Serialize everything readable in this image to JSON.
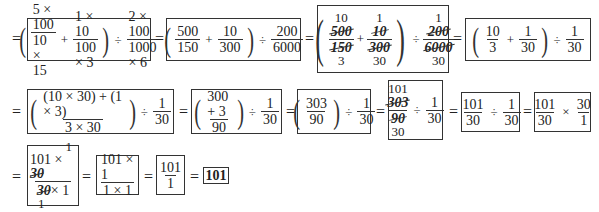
{
  "equals": "=",
  "ops": {
    "times": "×",
    "divide": "÷",
    "plus": "+",
    "lparen": "(",
    "rparen": ")"
  },
  "rows": [
    {
      "steps": [
        {
          "id": "s1",
          "f1": {
            "num": "5 × 100",
            "den": "10 × 15"
          },
          "f2": {
            "num": "1 × 10",
            "den": "100 × 3"
          },
          "f3": {
            "num": "2 × 100",
            "den": "1000 × 6"
          }
        },
        {
          "id": "s2",
          "f1": {
            "num": "500",
            "den": "150"
          },
          "f2": {
            "num": "10",
            "den": "300"
          },
          "f3": {
            "num": "200",
            "den": "6000"
          }
        },
        {
          "id": "s3",
          "f1": {
            "top": "10",
            "num": "500",
            "den": "150",
            "bottom": "3"
          },
          "f2": {
            "top": "1",
            "num": "10",
            "den": "300",
            "bottom": "30"
          },
          "f3": {
            "top": "1",
            "num": "200",
            "den": "6000",
            "bottom": "30"
          }
        },
        {
          "id": "s4",
          "f1": {
            "num": "10",
            "den": "3"
          },
          "f2": {
            "num": "1",
            "den": "30"
          },
          "f3": {
            "num": "1",
            "den": "30"
          }
        }
      ]
    },
    {
      "steps": [
        {
          "id": "s5",
          "f1": {
            "num": "(10 × 30) + (1 × 3)",
            "den": "3 × 30"
          },
          "f2": {
            "num": "1",
            "den": "30"
          }
        },
        {
          "id": "s6",
          "f1": {
            "num": "300 + 3",
            "den": "90"
          },
          "f2": {
            "num": "1",
            "den": "30"
          }
        },
        {
          "id": "s7",
          "f1": {
            "num": "303",
            "den": "90"
          },
          "f2": {
            "num": "1",
            "den": "30"
          }
        },
        {
          "id": "s8",
          "f1": {
            "top": "101",
            "num": "303",
            "den": "90",
            "bottom": "30"
          },
          "f2": {
            "num": "1",
            "den": "30"
          }
        },
        {
          "id": "s9",
          "f1": {
            "num": "101",
            "den": "30"
          },
          "f2": {
            "num": "1",
            "den": "30"
          }
        },
        {
          "id": "s10",
          "f1": {
            "num": "101",
            "den": "30"
          },
          "f2": {
            "num": "30",
            "den": "1"
          }
        }
      ]
    },
    {
      "steps": [
        {
          "id": "s11",
          "f1": {
            "num_a": "101 × ",
            "num_b": "30",
            "num_top": "1",
            "den_a": "30",
            "den_b": "× 1",
            "den_bottom": "1"
          }
        },
        {
          "id": "s12",
          "f1": {
            "num": "101 × 1",
            "den": "1 × 1"
          }
        },
        {
          "id": "s13",
          "f1": {
            "num": "101",
            "den": "1"
          }
        },
        {
          "id": "s14",
          "result": "101"
        }
      ]
    }
  ]
}
